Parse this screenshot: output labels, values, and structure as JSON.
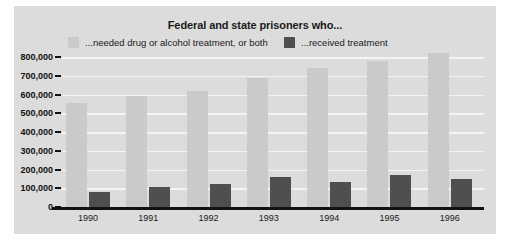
{
  "chart_data": {
    "type": "bar",
    "title": "Federal and state prisoners who...",
    "xlabel": "",
    "ylabel": "",
    "categories": [
      "1990",
      "1991",
      "1992",
      "1993",
      "1994",
      "1995",
      "1996"
    ],
    "series": [
      {
        "name": "...needed drug or alcohol treatment, or both",
        "color": "#cacaca",
        "values": [
          555000,
          590000,
          620000,
          690000,
          740000,
          780000,
          820000
        ]
      },
      {
        "name": "...received treatment",
        "color": "#4f4f4f",
        "values": [
          80000,
          105000,
          125000,
          160000,
          135000,
          170000,
          150000
        ]
      }
    ],
    "ylim": [
      0,
      800000
    ],
    "ytick_values": [
      0,
      100000,
      200000,
      300000,
      400000,
      500000,
      600000,
      700000,
      800000
    ],
    "ytick_labels": [
      "0",
      "100,000",
      "200,000",
      "300,000",
      "400,000",
      "500,000",
      "600,000",
      "700,000",
      "800,000"
    ],
    "grid": true,
    "legend_position": "top"
  },
  "legend": {
    "items": [
      {
        "label": "...needed drug or alcohol treatment, or both",
        "color": "#cacaca"
      },
      {
        "label": "...received treatment",
        "color": "#4f4f4f"
      }
    ]
  },
  "colors": {
    "panel_background": "#dcdcdc",
    "figure_background": "#ffffff",
    "gridline": "#f4f4f4",
    "axis": "#111111",
    "text": "#1a1a1a",
    "needed_bar": "#cacaca",
    "received_bar": "#4f4f4f"
  }
}
